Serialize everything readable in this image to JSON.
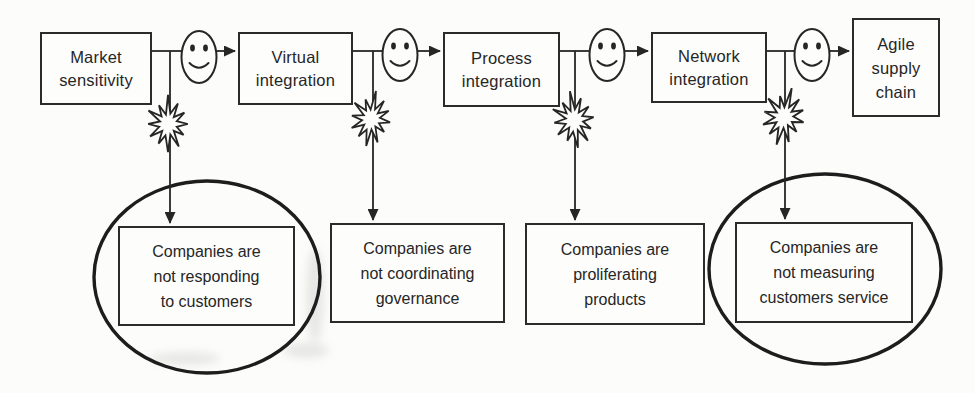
{
  "colors": {
    "ink": "#262626",
    "line": "#262626",
    "paper": "#fcfcfa",
    "highlight_ring": "#1d1d1d"
  },
  "stages": [
    {
      "id": "market-sensitivity",
      "label": "Market sensitivity",
      "lines": [
        "Market",
        "sensitivity"
      ]
    },
    {
      "id": "virtual-integration",
      "label": "Virtual integration",
      "lines": [
        "Virtual",
        "integration"
      ]
    },
    {
      "id": "process-integration",
      "label": "Process integration",
      "lines": [
        "Process",
        "integration"
      ]
    },
    {
      "id": "network-integration",
      "label": "Network integration",
      "lines": [
        "Network",
        "integration"
      ]
    },
    {
      "id": "agile-supply-chain",
      "label": "Agile supply chain",
      "lines": [
        "Agile",
        "supply",
        "chain"
      ]
    }
  ],
  "problems": [
    {
      "id": "not-responding",
      "label": "Companies are not responding to customers",
      "lines": [
        "Companies are",
        "not responding",
        "to customers"
      ],
      "circled": true
    },
    {
      "id": "not-coordinating",
      "label": "Companies are not coordinating governance",
      "lines": [
        "Companies are",
        "not coordinating",
        "governance"
      ],
      "circled": false
    },
    {
      "id": "proliferating",
      "label": "Companies are proliferating products",
      "lines": [
        "Companies are",
        "proliferating",
        "products"
      ],
      "circled": false
    },
    {
      "id": "not-measuring",
      "label": "Companies are not measuring customers service",
      "lines": [
        "Companies are",
        "not measuring",
        "customers service"
      ],
      "circled": true
    }
  ],
  "flow": {
    "sequence": [
      "Market sensitivity",
      "Virtual integration",
      "Process integration",
      "Network integration",
      "Agile supply chain"
    ],
    "connector_icon": "smiley-face",
    "junction_icon": "starburst",
    "arrow_style": "filled-arrowhead"
  },
  "problem_links": [
    {
      "stage": "Market sensitivity",
      "problem": "Companies are not responding to customers",
      "circled": true
    },
    {
      "stage": "Virtual integration",
      "problem": "Companies are not coordinating governance",
      "circled": false
    },
    {
      "stage": "Process integration",
      "problem": "Companies are proliferating products",
      "circled": false
    },
    {
      "stage": "Network integration",
      "problem": "Companies are not measuring customers service",
      "circled": true
    }
  ]
}
